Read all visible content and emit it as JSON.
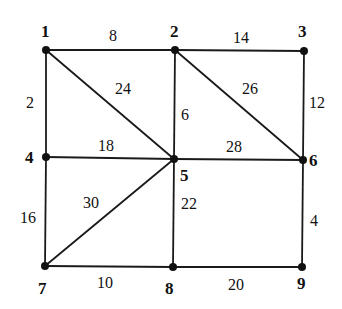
{
  "graph": {
    "nodes": [
      {
        "id": "1",
        "label": "1",
        "x": 46,
        "y": 50,
        "lx": 41,
        "ly": 37
      },
      {
        "id": "2",
        "label": "2",
        "x": 175,
        "y": 50,
        "lx": 170,
        "ly": 37
      },
      {
        "id": "3",
        "label": "3",
        "x": 304,
        "y": 51,
        "lx": 298,
        "ly": 37
      },
      {
        "id": "4",
        "label": "4",
        "x": 46,
        "y": 157,
        "lx": 25,
        "ly": 163
      },
      {
        "id": "5",
        "label": "5",
        "x": 174,
        "y": 159,
        "lx": 180,
        "ly": 181
      },
      {
        "id": "6",
        "label": "6",
        "x": 303,
        "y": 160,
        "lx": 309,
        "ly": 166
      },
      {
        "id": "7",
        "label": "7",
        "x": 45,
        "y": 266,
        "lx": 38,
        "ly": 294
      },
      {
        "id": "8",
        "label": "8",
        "x": 173,
        "y": 267,
        "lx": 165,
        "ly": 294
      },
      {
        "id": "9",
        "label": "9",
        "x": 302,
        "y": 267,
        "lx": 297,
        "ly": 289
      }
    ],
    "edges": [
      {
        "from": "1",
        "to": "2",
        "weight": "8",
        "lx": 109,
        "ly": 41
      },
      {
        "from": "2",
        "to": "3",
        "weight": "14",
        "lx": 233,
        "ly": 43
      },
      {
        "from": "1",
        "to": "4",
        "weight": "2",
        "lx": 26,
        "ly": 108
      },
      {
        "from": "1",
        "to": "5",
        "weight": "24",
        "lx": 115,
        "ly": 94
      },
      {
        "from": "2",
        "to": "5",
        "weight": "6",
        "lx": 181,
        "ly": 120
      },
      {
        "from": "2",
        "to": "6",
        "weight": "26",
        "lx": 242,
        "ly": 94
      },
      {
        "from": "3",
        "to": "6",
        "weight": "12",
        "lx": 309,
        "ly": 108
      },
      {
        "from": "4",
        "to": "5",
        "weight": "18",
        "lx": 98,
        "ly": 151
      },
      {
        "from": "5",
        "to": "6",
        "weight": "28",
        "lx": 226,
        "ly": 152
      },
      {
        "from": "4",
        "to": "7",
        "weight": "16",
        "lx": 20,
        "ly": 223
      },
      {
        "from": "5",
        "to": "7",
        "weight": "30",
        "lx": 83,
        "ly": 208
      },
      {
        "from": "5",
        "to": "8",
        "weight": "22",
        "lx": 181,
        "ly": 209
      },
      {
        "from": "6",
        "to": "9",
        "weight": "4",
        "lx": 310,
        "ly": 226
      },
      {
        "from": "7",
        "to": "8",
        "weight": "10",
        "lx": 97,
        "ly": 288
      },
      {
        "from": "8",
        "to": "9",
        "weight": "20",
        "lx": 228,
        "ly": 290
      }
    ]
  }
}
